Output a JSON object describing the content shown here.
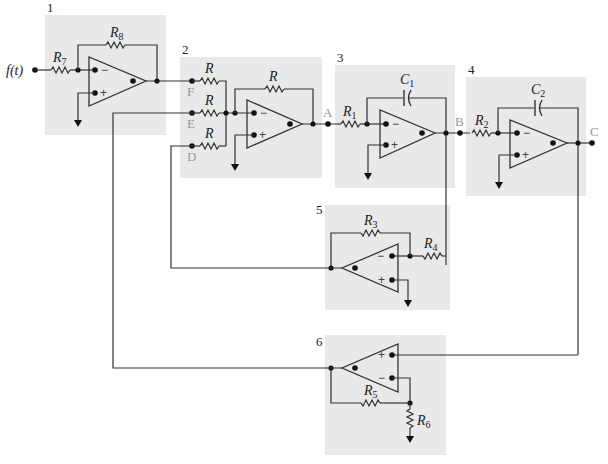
{
  "diagram": {
    "type": "analog-computer-circuit",
    "blocks": [
      {
        "id": "1",
        "label": "1"
      },
      {
        "id": "2",
        "label": "2"
      },
      {
        "id": "3",
        "label": "3"
      },
      {
        "id": "4",
        "label": "4"
      },
      {
        "id": "5",
        "label": "5"
      },
      {
        "id": "6",
        "label": "6"
      }
    ],
    "input": {
      "label": "f(t)"
    },
    "nodes": {
      "A": "A",
      "B": "B",
      "C": "C",
      "D": "D",
      "E": "E",
      "F": "F"
    },
    "components": {
      "R7": {
        "main": "R",
        "sub": "7"
      },
      "R8": {
        "main": "R",
        "sub": "8"
      },
      "R_F": {
        "main": "R"
      },
      "R_E": {
        "main": "R"
      },
      "R_D": {
        "main": "R"
      },
      "R_fb2": {
        "main": "R"
      },
      "R1": {
        "main": "R",
        "sub": "1"
      },
      "C1": {
        "main": "C",
        "sub": "1"
      },
      "R2": {
        "main": "R",
        "sub": "2"
      },
      "C2": {
        "main": "C",
        "sub": "2"
      },
      "R3": {
        "main": "R",
        "sub": "3"
      },
      "R4": {
        "main": "R",
        "sub": "4"
      },
      "R5": {
        "main": "R",
        "sub": "5"
      },
      "R6": {
        "main": "R",
        "sub": "6"
      }
    },
    "signs": {
      "minus": "−",
      "plus": "+"
    },
    "colors": {
      "box": "#e9e9e9",
      "wire": "#333333",
      "node_label": "#999999"
    }
  }
}
